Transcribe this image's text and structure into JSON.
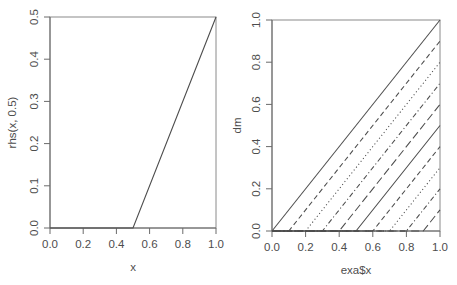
{
  "figure": {
    "type": "r-base-graphics-multipanel",
    "panels": 2,
    "background": "#ffffff",
    "ink_color": "#4d4d4d",
    "truncated_title_top_right": ""
  },
  "chart_data": [
    {
      "panel": "left",
      "type": "line",
      "title": "",
      "xlabel": "x",
      "ylabel": "rhs(x, 0.5)",
      "xlim": [
        0.0,
        1.0
      ],
      "ylim": [
        0.0,
        0.5
      ],
      "xticks": [
        "0.0",
        "0.2",
        "0.4",
        "0.6",
        "0.8",
        "1.0"
      ],
      "xtickvals": [
        0.0,
        0.2,
        0.4,
        0.6,
        0.8,
        1.0
      ],
      "yticks": [
        "0.0",
        "0.1",
        "0.2",
        "0.3",
        "0.4",
        "0.5"
      ],
      "ytickvals": [
        0.0,
        0.1,
        0.2,
        0.3,
        0.4,
        0.5
      ],
      "grid": false,
      "legend": "none",
      "series": [
        {
          "name": "rhs(x, 0.5)",
          "linetype": "solid",
          "description": "hinge function max(0, x - 0.5); flat at 0 until knot 0.5 then linear slope 1",
          "knot": 0.5,
          "x": [
            0.0,
            0.5,
            1.0
          ],
          "values": [
            0.0,
            0.0,
            0.5
          ]
        }
      ]
    },
    {
      "panel": "right",
      "type": "line",
      "title": "",
      "xlabel": "exa$x",
      "ylabel": "dm",
      "xlim": [
        0.0,
        1.0
      ],
      "ylim": [
        0.0,
        1.0
      ],
      "xticks": [
        "0.0",
        "0.2",
        "0.4",
        "0.6",
        "0.8",
        "1.0"
      ],
      "xtickvals": [
        0.0,
        0.2,
        0.4,
        0.6,
        0.8,
        1.0
      ],
      "yticks": [
        "0.0",
        "0.2",
        "0.4",
        "0.6",
        "0.8",
        "1.0"
      ],
      "ytickvals": [
        0.0,
        0.2,
        0.4,
        0.6,
        0.8,
        1.0
      ],
      "grid": false,
      "legend": "none",
      "description": "Ten right-hand hinge basis functions max(0, x - k) for knots k = 0.0 .. 0.9, drawn with cycling R line types",
      "series": [
        {
          "name": "rhs(x, 0.0)",
          "knot": 0.0,
          "linetype": "solid",
          "x": [
            0.0,
            1.0
          ],
          "values": [
            0.0,
            1.0
          ]
        },
        {
          "name": "rhs(x, 0.1)",
          "knot": 0.1,
          "linetype": "dashed",
          "x": [
            0.0,
            0.1,
            1.0
          ],
          "values": [
            0.0,
            0.0,
            0.9
          ]
        },
        {
          "name": "rhs(x, 0.2)",
          "knot": 0.2,
          "linetype": "dotted",
          "x": [
            0.0,
            0.2,
            1.0
          ],
          "values": [
            0.0,
            0.0,
            0.8
          ]
        },
        {
          "name": "rhs(x, 0.3)",
          "knot": 0.3,
          "linetype": "dotdash",
          "x": [
            0.0,
            0.3,
            1.0
          ],
          "values": [
            0.0,
            0.0,
            0.7
          ]
        },
        {
          "name": "rhs(x, 0.4)",
          "knot": 0.4,
          "linetype": "longdash",
          "x": [
            0.0,
            0.4,
            1.0
          ],
          "values": [
            0.0,
            0.0,
            0.6
          ]
        },
        {
          "name": "rhs(x, 0.5)",
          "knot": 0.5,
          "linetype": "solid",
          "x": [
            0.0,
            0.5,
            1.0
          ],
          "values": [
            0.0,
            0.0,
            0.5
          ]
        },
        {
          "name": "rhs(x, 0.6)",
          "knot": 0.6,
          "linetype": "dashed",
          "x": [
            0.0,
            0.6,
            1.0
          ],
          "values": [
            0.0,
            0.0,
            0.4
          ]
        },
        {
          "name": "rhs(x, 0.7)",
          "knot": 0.7,
          "linetype": "dotted",
          "x": [
            0.0,
            0.7,
            1.0
          ],
          "values": [
            0.0,
            0.0,
            0.3
          ]
        },
        {
          "name": "rhs(x, 0.8)",
          "knot": 0.8,
          "linetype": "dotdash",
          "x": [
            0.0,
            0.8,
            1.0
          ],
          "values": [
            0.0,
            0.0,
            0.2
          ]
        },
        {
          "name": "rhs(x, 0.9)",
          "knot": 0.9,
          "linetype": "longdash",
          "x": [
            0.0,
            0.9,
            1.0
          ],
          "values": [
            0.0,
            0.0,
            0.1
          ]
        }
      ]
    }
  ],
  "left_panel": {
    "xlabel": "x",
    "ylabel": "rhs(x, 0.5)",
    "xticks": [
      "0.0",
      "0.2",
      "0.4",
      "0.6",
      "0.8",
      "1.0"
    ],
    "yticks": [
      "0.0",
      "0.1",
      "0.2",
      "0.3",
      "0.4",
      "0.5"
    ]
  },
  "right_panel": {
    "xlabel": "exa$x",
    "ylabel": "dm",
    "xticks": [
      "0.0",
      "0.2",
      "0.4",
      "0.6",
      "0.8",
      "1.0"
    ],
    "yticks": [
      "0.0",
      "0.2",
      "0.4",
      "0.6",
      "0.8",
      "1.0"
    ]
  }
}
